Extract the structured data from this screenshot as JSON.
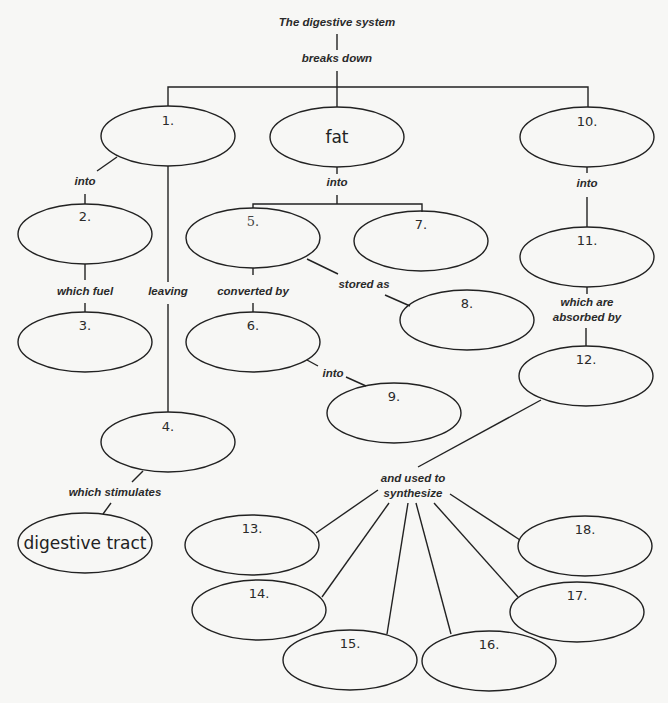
{
  "diagram": {
    "title": "The digestive system",
    "root_link": "breaks down",
    "nodes": {
      "n1": "1.",
      "fat": "fat",
      "n10": "10.",
      "n2": "2.",
      "n3": "3.",
      "n4": "4.",
      "n5": "5.",
      "n6": "6.",
      "n7": "7.",
      "n8": "8.",
      "n9": "9.",
      "n11": "11.",
      "n12": "12.",
      "n13": "13.",
      "n14": "14.",
      "n15": "15.",
      "n16": "16.",
      "n17": "17.",
      "n18": "18.",
      "digestive_tract": "digestive tract"
    },
    "links": {
      "n1_into": "into",
      "n2_which_fuel": "which fuel",
      "n1_leaving": "leaving",
      "n4_which_stimulates": "which stimulates",
      "fat_into": "into",
      "n5_converted_by": "converted by",
      "n5_stored_as": "stored as",
      "n6_into": "into",
      "n10_into": "into",
      "n11_absorbed_1": "which are",
      "n11_absorbed_2": "absorbed by",
      "n12_used_1": "and used to",
      "n12_used_2": "synthesize"
    },
    "colors": {
      "stroke": "#222222",
      "background": "#f7f7f5"
    }
  }
}
